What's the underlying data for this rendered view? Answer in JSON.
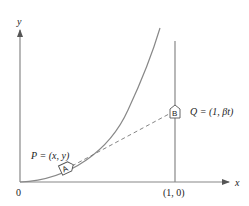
{
  "diagram": {
    "axes": {
      "x_label": "x",
      "y_label": "y",
      "origin_label": "0"
    },
    "tick_label": "(1, 0)",
    "point_p_label": "P = (x, y)",
    "point_q_label": "Q = (1, βt)",
    "marker_a": "A",
    "marker_b": "B",
    "colors": {
      "line": "#777777",
      "text": "#222222",
      "background": "#ffffff"
    }
  }
}
